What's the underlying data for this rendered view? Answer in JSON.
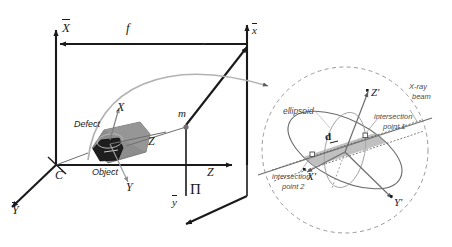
{
  "figure": {
    "colors": {
      "line": "#1a1a1a",
      "gray_line": "#8c8c8c",
      "mid_gray": "#5a5a5a",
      "object_fill": "#8d8d8d",
      "defect_fill": "#1e1e1e",
      "ellipsoid_band": "#a8a8a8",
      "dashed_circle": "#9a9a9a"
    }
  },
  "world_frame": {
    "axis_x_label": "X",
    "axis_y_label": "Y",
    "axis_z_label": "Z",
    "origin_label": "C",
    "focal_label": "f"
  },
  "image_plane": {
    "plane_label": "Π",
    "axis_x_label": "x",
    "axis_y_label": "y",
    "projected_point_label": "m"
  },
  "object_frame": {
    "axis_x_label": "X",
    "axis_y_label": "Y",
    "axis_z_label": "Z",
    "object_label": "Object",
    "defect_label": "Defect"
  },
  "detail_view": {
    "ellipsoid_label": "ellipsoid",
    "beam_label_line1": "X-ray",
    "beam_label_line2": "beam",
    "chord_label": "d",
    "intersection_1_line1": "intersection",
    "intersection_1_line2": "point 1",
    "intersection_2_line1": "intersection",
    "intersection_2_line2": "point 2",
    "axis_x_label": "X'",
    "axis_y_label": "Y'",
    "axis_z_label": "Z'"
  }
}
